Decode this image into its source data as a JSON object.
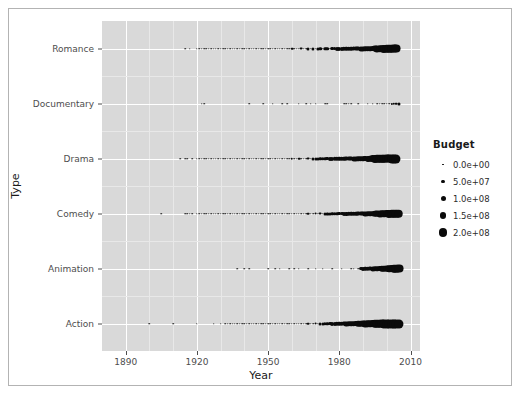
{
  "figure": {
    "background": "#ffffff",
    "border_color": "#b3b3b3",
    "panel_background": "#d9d9d9",
    "grid_color": "#ffffff",
    "point_color": "#0a0a0a"
  },
  "axes": {
    "xlabel": "Year",
    "ylabel": "Type"
  },
  "legend": {
    "title": "Budget",
    "items": [
      {
        "label": "0.0e+00",
        "value": 0,
        "size": 1.6
      },
      {
        "label": "5.0e+07",
        "value": 50000000,
        "size": 3.2
      },
      {
        "label": "1.0e+08",
        "value": 100000000,
        "size": 5.0
      },
      {
        "label": "1.5e+08",
        "value": 150000000,
        "size": 6.8
      },
      {
        "label": "2.0e+08",
        "value": 200000000,
        "size": 8.6
      }
    ]
  },
  "chart_data": {
    "type": "scatter",
    "title": "",
    "xlabel": "Year",
    "ylabel": "Type",
    "grid": true,
    "legend_position": "right",
    "size_legend": {
      "title": "Budget",
      "breaks": [
        0,
        50000000,
        100000000,
        150000000,
        200000000
      ],
      "break_labels": [
        "0.0e+00",
        "5.0e+07",
        "1.0e+08",
        "1.5e+08",
        "2.0e+08"
      ]
    },
    "xlim": [
      1880,
      2014
    ],
    "xticks": [
      1890,
      1920,
      1950,
      1980,
      2010
    ],
    "xtick_labels": [
      "1890",
      "1920",
      "1950",
      "1980",
      "2010"
    ],
    "categories": [
      "Action",
      "Animation",
      "Comedy",
      "Drama",
      "Documentary",
      "Romance"
    ],
    "ytick_labels_top_to_bottom": [
      "Romance",
      "Documentary",
      "Drama",
      "Comedy",
      "Animation",
      "Action"
    ],
    "size_encodes": "Budget",
    "series": [
      {
        "name": "Romance",
        "x": [
          1915,
          1917,
          1920,
          1921,
          1922,
          1923,
          1924,
          1925,
          1926,
          1927,
          1928,
          1929,
          1930,
          1931,
          1932,
          1933,
          1934,
          1935,
          1936,
          1937,
          1938,
          1939,
          1940,
          1941,
          1942,
          1943,
          1944,
          1945,
          1946,
          1947,
          1948,
          1949,
          1950,
          1951,
          1952,
          1953,
          1954,
          1955,
          1956,
          1957,
          1958,
          1959,
          1960,
          1961,
          1962,
          1963,
          1964,
          1965,
          1966,
          1967,
          1968,
          1969,
          1970,
          1971,
          1972,
          1973,
          1974,
          1975,
          1976,
          1977,
          1978,
          1979,
          1980,
          1981,
          1982,
          1983,
          1984,
          1985,
          1986,
          1987,
          1988,
          1989,
          1990,
          1991,
          1992,
          1993,
          1994,
          1995,
          1996,
          1997,
          1998,
          1999,
          2000,
          2001,
          2002,
          2003,
          2004,
          2005
        ],
        "budget": [
          0,
          0,
          0,
          0,
          0,
          0,
          0,
          0,
          0,
          0,
          0,
          0,
          0,
          0,
          0,
          0,
          0,
          0,
          0,
          0,
          0,
          0,
          0,
          0,
          0,
          0,
          0,
          0,
          0,
          0,
          0,
          0,
          0,
          0,
          0,
          0,
          0,
          0,
          0,
          0,
          0,
          0,
          5000000,
          0,
          0,
          0,
          6000000,
          0,
          0,
          8000000,
          0,
          9000000,
          0,
          10000000,
          12000000,
          0,
          14000000,
          15000000,
          0,
          18000000,
          20000000,
          22000000,
          25000000,
          26000000,
          28000000,
          30000000,
          32000000,
          35000000,
          38000000,
          40000000,
          42000000,
          45000000,
          48000000,
          50000000,
          55000000,
          60000000,
          65000000,
          100000000,
          110000000,
          120000000,
          130000000,
          150000000,
          160000000,
          170000000,
          180000000,
          185000000,
          190000000
        ]
      },
      {
        "name": "Documentary",
        "x": [
          1922,
          1923,
          1942,
          1948,
          1952,
          1956,
          1958,
          1963,
          1966,
          1968,
          1970,
          1974,
          1975,
          1982,
          1983,
          1984,
          1985,
          1988,
          1992,
          1994,
          1996,
          1997,
          1998,
          1999,
          2000,
          2001,
          2002,
          2003,
          2004,
          2005
        ],
        "budget": [
          0,
          0,
          0,
          0,
          0,
          0,
          0,
          0,
          0,
          0,
          0,
          0,
          0,
          0,
          0,
          0,
          0,
          0,
          0,
          0,
          0,
          0,
          0,
          0,
          0,
          0,
          2000000,
          3000000,
          5000000,
          8000000
        ]
      },
      {
        "name": "Drama",
        "x": [
          1913,
          1915,
          1916,
          1918,
          1920,
          1921,
          1922,
          1923,
          1924,
          1925,
          1926,
          1927,
          1928,
          1929,
          1930,
          1931,
          1932,
          1933,
          1934,
          1935,
          1936,
          1937,
          1938,
          1939,
          1940,
          1941,
          1942,
          1943,
          1944,
          1945,
          1946,
          1947,
          1948,
          1949,
          1950,
          1951,
          1952,
          1953,
          1954,
          1955,
          1956,
          1957,
          1958,
          1959,
          1960,
          1961,
          1962,
          1963,
          1964,
          1965,
          1966,
          1967,
          1968,
          1969,
          1970,
          1971,
          1972,
          1973,
          1974,
          1975,
          1976,
          1977,
          1978,
          1979,
          1980,
          1981,
          1982,
          1983,
          1984,
          1985,
          1986,
          1987,
          1988,
          1989,
          1990,
          1991,
          1992,
          1993,
          1994,
          1995,
          1996,
          1997,
          1998,
          1999,
          2000,
          2001,
          2002,
          2003,
          2004,
          2005
        ],
        "budget": [
          0,
          0,
          0,
          0,
          0,
          0,
          0,
          0,
          0,
          0,
          0,
          0,
          0,
          0,
          0,
          0,
          0,
          0,
          0,
          0,
          0,
          0,
          0,
          0,
          0,
          0,
          0,
          0,
          0,
          0,
          0,
          0,
          0,
          0,
          0,
          0,
          0,
          0,
          0,
          0,
          0,
          0,
          0,
          0,
          4000000,
          0,
          0,
          5000000,
          0,
          0,
          0,
          6000000,
          0,
          8000000,
          9000000,
          10000000,
          12000000,
          14000000,
          16000000,
          18000000,
          22000000,
          25000000,
          28000000,
          30000000,
          32000000,
          35000000,
          36000000,
          38000000,
          40000000,
          42000000,
          45000000,
          48000000,
          52000000,
          58000000,
          62000000,
          68000000,
          75000000,
          85000000,
          140000000,
          150000000,
          160000000,
          170000000,
          175000000,
          180000000,
          185000000,
          190000000,
          195000000,
          200000000,
          200000000
        ]
      },
      {
        "name": "Comedy",
        "x": [
          1905,
          1915,
          1916,
          1917,
          1918,
          1920,
          1921,
          1922,
          1923,
          1924,
          1925,
          1926,
          1927,
          1928,
          1929,
          1930,
          1931,
          1932,
          1933,
          1934,
          1935,
          1936,
          1937,
          1938,
          1939,
          1940,
          1941,
          1942,
          1943,
          1944,
          1945,
          1946,
          1947,
          1948,
          1949,
          1950,
          1951,
          1952,
          1953,
          1954,
          1955,
          1956,
          1957,
          1958,
          1959,
          1960,
          1961,
          1962,
          1963,
          1964,
          1965,
          1966,
          1967,
          1968,
          1969,
          1970,
          1971,
          1972,
          1973,
          1974,
          1975,
          1976,
          1977,
          1978,
          1979,
          1980,
          1981,
          1982,
          1983,
          1984,
          1985,
          1986,
          1987,
          1988,
          1989,
          1990,
          1991,
          1992,
          1993,
          1994,
          1995,
          1996,
          1997,
          1998,
          1999,
          2000,
          2001,
          2002,
          2003,
          2004,
          2005
        ],
        "budget": [
          0,
          0,
          0,
          0,
          0,
          0,
          0,
          0,
          0,
          0,
          0,
          0,
          0,
          0,
          0,
          0,
          0,
          0,
          0,
          0,
          0,
          0,
          0,
          0,
          0,
          0,
          0,
          0,
          0,
          0,
          0,
          0,
          0,
          0,
          0,
          0,
          0,
          0,
          0,
          0,
          0,
          0,
          0,
          0,
          0,
          0,
          0,
          0,
          0,
          0,
          0,
          0,
          5000000,
          0,
          0,
          6000000,
          0,
          7000000,
          0,
          8000000,
          9000000,
          10000000,
          12000000,
          14000000,
          16000000,
          18000000,
          20000000,
          22000000,
          25000000,
          28000000,
          30000000,
          32000000,
          35000000,
          38000000,
          40000000,
          42000000,
          45000000,
          50000000,
          55000000,
          60000000,
          90000000,
          100000000,
          110000000,
          120000000,
          130000000,
          140000000,
          150000000,
          160000000,
          165000000,
          170000000,
          175000000
        ]
      },
      {
        "name": "Animation",
        "x": [
          1937,
          1940,
          1942,
          1950,
          1953,
          1955,
          1959,
          1961,
          1963,
          1967,
          1970,
          1973,
          1977,
          1981,
          1985,
          1986,
          1988,
          1989,
          1990,
          1991,
          1992,
          1993,
          1994,
          1995,
          1996,
          1997,
          1998,
          1999,
          2000,
          2001,
          2002,
          2003,
          2004,
          2005
        ],
        "budget": [
          0,
          0,
          0,
          0,
          0,
          0,
          0,
          0,
          0,
          0,
          0,
          0,
          0,
          0,
          0,
          0,
          0,
          20000000,
          25000000,
          28000000,
          30000000,
          40000000,
          45000000,
          50000000,
          60000000,
          70000000,
          80000000,
          90000000,
          100000000,
          120000000,
          140000000,
          160000000,
          180000000,
          190000000
        ]
      },
      {
        "name": "Action",
        "x": [
          1900,
          1910,
          1920,
          1927,
          1930,
          1932,
          1933,
          1934,
          1935,
          1936,
          1937,
          1938,
          1939,
          1940,
          1941,
          1942,
          1943,
          1944,
          1945,
          1946,
          1947,
          1948,
          1949,
          1950,
          1951,
          1952,
          1953,
          1954,
          1955,
          1956,
          1957,
          1958,
          1959,
          1960,
          1961,
          1962,
          1963,
          1964,
          1965,
          1966,
          1967,
          1968,
          1969,
          1970,
          1971,
          1972,
          1973,
          1974,
          1975,
          1976,
          1977,
          1978,
          1979,
          1980,
          1981,
          1982,
          1983,
          1984,
          1985,
          1986,
          1987,
          1988,
          1989,
          1990,
          1991,
          1992,
          1993,
          1994,
          1995,
          1996,
          1997,
          1998,
          1999,
          2000,
          2001,
          2002,
          2003,
          2004,
          2005
        ],
        "budget": [
          0,
          0,
          0,
          0,
          0,
          0,
          0,
          0,
          0,
          0,
          0,
          0,
          0,
          0,
          0,
          0,
          0,
          0,
          0,
          0,
          0,
          0,
          0,
          0,
          0,
          0,
          0,
          0,
          0,
          0,
          0,
          0,
          0,
          0,
          0,
          0,
          0,
          0,
          0,
          0,
          5000000,
          0,
          0,
          6000000,
          0,
          8000000,
          10000000,
          12000000,
          14000000,
          18000000,
          22000000,
          25000000,
          28000000,
          32000000,
          35000000,
          40000000,
          45000000,
          50000000,
          55000000,
          60000000,
          70000000,
          80000000,
          90000000,
          100000000,
          110000000,
          120000000,
          130000000,
          145000000,
          160000000,
          170000000,
          180000000,
          190000000,
          195000000,
          200000000,
          200000000,
          200000000,
          200000000,
          200000000,
          200000000
        ]
      }
    ]
  }
}
